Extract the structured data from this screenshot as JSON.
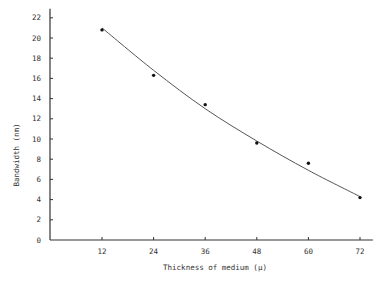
{
  "chart_data": {
    "type": "scatter",
    "title": "",
    "xlabel": "Thickness of medium (μ)",
    "ylabel": "Bandwidth (nm)",
    "x": [
      12,
      24,
      36,
      48,
      60,
      72
    ],
    "series": [
      {
        "name": "measured",
        "values": [
          20.8,
          16.3,
          13.4,
          9.6,
          7.6,
          4.2
        ],
        "style": "points"
      }
    ],
    "fit_curve": {
      "name": "fitted curve",
      "x": [
        12,
        24,
        36,
        48,
        60,
        72
      ],
      "values": [
        21.0,
        16.8,
        13.0,
        9.8,
        6.9,
        4.3
      ]
    },
    "xlim": [
      0,
      75
    ],
    "ylim": [
      0,
      22.5
    ],
    "xticks": [
      12,
      24,
      36,
      48,
      60,
      72
    ],
    "yticks": [
      0,
      2,
      4,
      6,
      8,
      10,
      12,
      14,
      16,
      18,
      20,
      22
    ],
    "grid": false,
    "legend": "none",
    "colors": {
      "ink": "#333333",
      "curve": "#555555"
    }
  }
}
